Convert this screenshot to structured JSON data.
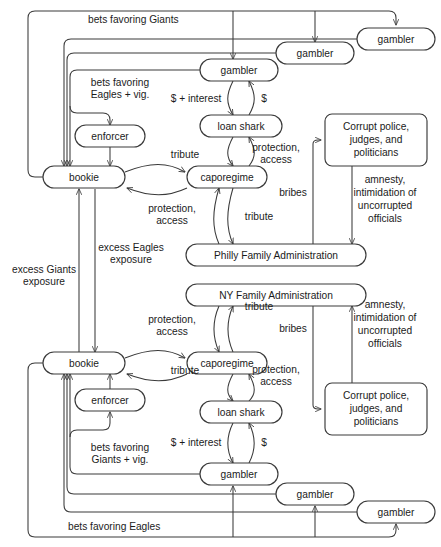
{
  "diagram": {
    "type": "flow-diagram",
    "colors": {
      "stroke": "#3a3a3a",
      "text": "#1b1b1b",
      "background": "#ffffff"
    },
    "nodes": [
      {
        "id": "p-gambler-3",
        "label": "gambler",
        "shape": "stadium",
        "x": 396,
        "y": 39,
        "w": 78,
        "h": 22
      },
      {
        "id": "p-gambler-2",
        "label": "gambler",
        "shape": "stadium",
        "x": 315,
        "y": 53,
        "w": 78,
        "h": 22
      },
      {
        "id": "p-gambler-1",
        "label": "gambler",
        "shape": "stadium",
        "x": 239,
        "y": 70,
        "w": 78,
        "h": 22
      },
      {
        "id": "p-enforcer",
        "label": "enforcer",
        "shape": "stadium",
        "x": 110,
        "y": 136,
        "w": 70,
        "h": 22
      },
      {
        "id": "p-loanshark",
        "label": "loan shark",
        "shape": "stadium",
        "x": 241,
        "y": 126,
        "w": 82,
        "h": 22
      },
      {
        "id": "p-bookie",
        "label": "bookie",
        "shape": "stadium",
        "x": 84,
        "y": 177,
        "w": 82,
        "h": 22
      },
      {
        "id": "p-capo",
        "label": "caporegime",
        "shape": "stadium",
        "x": 227,
        "y": 177,
        "w": 80,
        "h": 22
      },
      {
        "id": "p-corrupt",
        "label": "Corrupt police,|judges, and|politicians",
        "shape": "rect",
        "x": 376,
        "y": 140,
        "w": 102,
        "h": 52
      },
      {
        "id": "p-admin",
        "label": "Philly Family Administration",
        "shape": "stadium",
        "x": 276,
        "y": 255,
        "w": 180,
        "h": 22
      },
      {
        "id": "n-admin",
        "label": "NY Family Administration",
        "shape": "stadium",
        "x": 276,
        "y": 295,
        "w": 180,
        "h": 22
      },
      {
        "id": "n-capo",
        "label": "caporegime",
        "shape": "stadium",
        "x": 227,
        "y": 363,
        "w": 80,
        "h": 22
      },
      {
        "id": "n-bookie",
        "label": "bookie",
        "shape": "stadium",
        "x": 84,
        "y": 363,
        "w": 82,
        "h": 22
      },
      {
        "id": "n-corrupt",
        "label": "Corrupt police,|judges, and|politicians",
        "shape": "rect",
        "x": 376,
        "y": 409,
        "w": 102,
        "h": 52
      },
      {
        "id": "n-enforcer",
        "label": "enforcer",
        "shape": "stadium",
        "x": 110,
        "y": 400,
        "w": 70,
        "h": 22
      },
      {
        "id": "n-loanshark",
        "label": "loan shark",
        "shape": "stadium",
        "x": 241,
        "y": 412,
        "w": 82,
        "h": 22
      },
      {
        "id": "n-gambler-1",
        "label": "gambler",
        "shape": "stadium",
        "x": 239,
        "y": 474,
        "w": 78,
        "h": 22
      },
      {
        "id": "n-gambler-2",
        "label": "gambler",
        "shape": "stadium",
        "x": 315,
        "y": 494,
        "w": 78,
        "h": 22
      },
      {
        "id": "n-gambler-3",
        "label": "gambler",
        "shape": "stadium",
        "x": 396,
        "y": 512,
        "w": 78,
        "h": 22
      }
    ],
    "edge_labels": [
      {
        "id": "lbl-bets-giants-top",
        "text": "bets favoring Giants",
        "x": 88,
        "y": 20,
        "align": "start"
      },
      {
        "id": "lbl-bets-eagles-vig",
        "text": "bets favoring|Eagles + vig.",
        "x": 120,
        "y": 89,
        "align": "middle"
      },
      {
        "id": "lbl-p-interest",
        "text": "$ + interest",
        "x": 196,
        "y": 99,
        "align": "middle"
      },
      {
        "id": "lbl-p-dollar",
        "text": "$",
        "x": 258,
        "y": 99,
        "align": "middle"
      },
      {
        "id": "lbl-p-tribute-ls",
        "text": "tribute",
        "x": 185,
        "y": 155,
        "align": "middle"
      },
      {
        "id": "lbl-p-protection-ls",
        "text": "protection,|access",
        "x": 270,
        "y": 152,
        "align": "middle"
      },
      {
        "id": "lbl-p-protection-capo",
        "text": "protection,|access",
        "x": 172,
        "y": 211,
        "align": "middle"
      },
      {
        "id": "lbl-p-tribute-capo",
        "text": "tribute",
        "x": 259,
        "y": 217,
        "align": "middle"
      },
      {
        "id": "lbl-p-bribes",
        "text": "bribes",
        "x": 295,
        "y": 193,
        "align": "middle"
      },
      {
        "id": "lbl-p-amnesty",
        "text": "amnesty,|intimidation of|uncorrupted|officials",
        "x": 385,
        "y": 215,
        "align": "middle"
      },
      {
        "id": "lbl-excess-eagles",
        "text": "excess Eagles|exposure",
        "x": 128,
        "y": 253,
        "align": "middle"
      },
      {
        "id": "lbl-excess-giants",
        "text": "excess Giants|exposure",
        "x": 43,
        "y": 269,
        "align": "middle"
      },
      {
        "id": "lbl-n-protection-capo",
        "text": "protection,|access",
        "x": 172,
        "y": 323,
        "align": "middle"
      },
      {
        "id": "lbl-n-tribute-admin",
        "text": "tribute",
        "x": 259,
        "y": 305,
        "align": "middle"
      },
      {
        "id": "lbl-n-bribes",
        "text": "bribes",
        "x": 295,
        "y": 329,
        "align": "middle"
      },
      {
        "id": "lbl-n-amnesty",
        "text": "amnesty,|intimidation of|uncorrupted|officials",
        "x": 385,
        "y": 320,
        "align": "middle"
      },
      {
        "id": "lbl-n-tribute-ls",
        "text": "tribute",
        "x": 185,
        "y": 370,
        "align": "middle"
      },
      {
        "id": "lbl-n-protection-ls",
        "text": "protection,|access",
        "x": 270,
        "y": 374,
        "align": "middle"
      },
      {
        "id": "lbl-n-interest",
        "text": "$ + interest",
        "x": 196,
        "y": 443,
        "align": "middle"
      },
      {
        "id": "lbl-n-dollar",
        "text": "$",
        "x": 258,
        "y": 443,
        "align": "middle"
      },
      {
        "id": "lbl-bets-giants-vig",
        "text": "bets favoring|Giants + vig.",
        "x": 120,
        "y": 453,
        "align": "middle"
      },
      {
        "id": "lbl-bets-eagles-bot",
        "text": "bets favoring Eagles",
        "x": 68,
        "y": 527,
        "align": "start"
      }
    ],
    "edges": [
      {
        "id": "e-p-gambler1-loanshark",
        "from": "p-gambler-1",
        "to": "p-loanshark",
        "label": "$ + interest"
      },
      {
        "id": "e-p-loanshark-gambler1",
        "from": "p-loanshark",
        "to": "p-gambler-1",
        "label": "$"
      },
      {
        "id": "e-p-loanshark-capo",
        "from": "p-loanshark",
        "to": "p-capo",
        "label": "tribute"
      },
      {
        "id": "e-p-capo-loanshark",
        "from": "p-capo",
        "to": "p-loanshark",
        "label": "protection, access"
      },
      {
        "id": "e-p-bookie-capo",
        "from": "p-bookie",
        "to": "p-capo",
        "label": "tribute"
      },
      {
        "id": "e-p-capo-bookie",
        "from": "p-capo",
        "to": "p-bookie",
        "label": "protection, access"
      },
      {
        "id": "e-p-capo-admin",
        "from": "p-capo",
        "to": "p-admin",
        "label": "tribute"
      },
      {
        "id": "e-p-admin-capo",
        "from": "p-admin",
        "to": "p-capo",
        "label": "protection, access"
      },
      {
        "id": "e-p-admin-corrupt",
        "from": "p-admin",
        "to": "p-corrupt",
        "label": "bribes"
      },
      {
        "id": "e-p-corrupt-admin",
        "from": "p-corrupt",
        "to": "p-admin",
        "label": "amnesty, intimidation of uncorrupted officials"
      },
      {
        "id": "e-p-enforcer-bookie",
        "from": "p-enforcer",
        "to": "p-bookie",
        "label": ""
      },
      {
        "id": "e-p-gamblers-bookie",
        "from": "p-gambler-1",
        "to": "p-bookie",
        "label": "bets favoring Eagles + vig."
      },
      {
        "id": "e-p-bookie-gamblers",
        "from": "p-bookie",
        "to": "p-gambler-1",
        "label": "bets favoring Giants"
      },
      {
        "id": "e-bookie-bookie-giants",
        "from": "n-bookie",
        "to": "p-bookie",
        "label": "excess Giants exposure"
      },
      {
        "id": "e-bookie-bookie-eagles",
        "from": "p-bookie",
        "to": "n-bookie",
        "label": "excess Eagles exposure"
      },
      {
        "id": "e-n-gambler1-loanshark",
        "from": "n-gambler-1",
        "to": "n-loanshark",
        "label": "$ + interest"
      },
      {
        "id": "e-n-loanshark-gambler1",
        "from": "n-loanshark",
        "to": "n-gambler-1",
        "label": "$"
      },
      {
        "id": "e-n-loanshark-capo",
        "from": "n-loanshark",
        "to": "n-capo",
        "label": "tribute"
      },
      {
        "id": "e-n-capo-loanshark",
        "from": "n-capo",
        "to": "n-loanshark",
        "label": "protection, access"
      },
      {
        "id": "e-n-bookie-capo",
        "from": "n-bookie",
        "to": "n-capo",
        "label": "protection, access"
      },
      {
        "id": "e-n-capo-bookie",
        "from": "n-capo",
        "to": "n-bookie",
        "label": "tribute"
      },
      {
        "id": "e-n-capo-admin",
        "from": "n-capo",
        "to": "n-admin",
        "label": "tribute"
      },
      {
        "id": "e-n-admin-capo",
        "from": "n-admin",
        "to": "n-capo",
        "label": "protection, access"
      },
      {
        "id": "e-n-admin-corrupt",
        "from": "n-admin",
        "to": "n-corrupt",
        "label": "bribes"
      },
      {
        "id": "e-n-corrupt-admin",
        "from": "n-corrupt",
        "to": "n-admin",
        "label": "amnesty, intimidation of uncorrupted officials"
      },
      {
        "id": "e-n-enforcer-bookie",
        "from": "n-enforcer",
        "to": "n-bookie",
        "label": ""
      },
      {
        "id": "e-n-gamblers-bookie",
        "from": "n-gambler-1",
        "to": "n-bookie",
        "label": "bets favoring Giants + vig."
      },
      {
        "id": "e-n-bookie-gamblers",
        "from": "n-bookie",
        "to": "n-gambler-1",
        "label": "bets favoring Eagles"
      }
    ]
  }
}
